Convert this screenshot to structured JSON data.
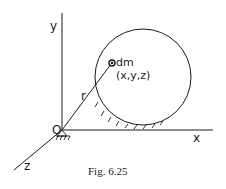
{
  "figure": {
    "caption": "Fig. 6.25",
    "labels": {
      "y_axis": "y",
      "x_axis": "x",
      "z_axis": "z",
      "origin": "O",
      "radius_vector": "r",
      "mass_element": "dm",
      "coordinates": "(x,y,z)"
    }
  },
  "colors": {
    "ink": "#1a1a1a",
    "background": "#ffffff"
  }
}
